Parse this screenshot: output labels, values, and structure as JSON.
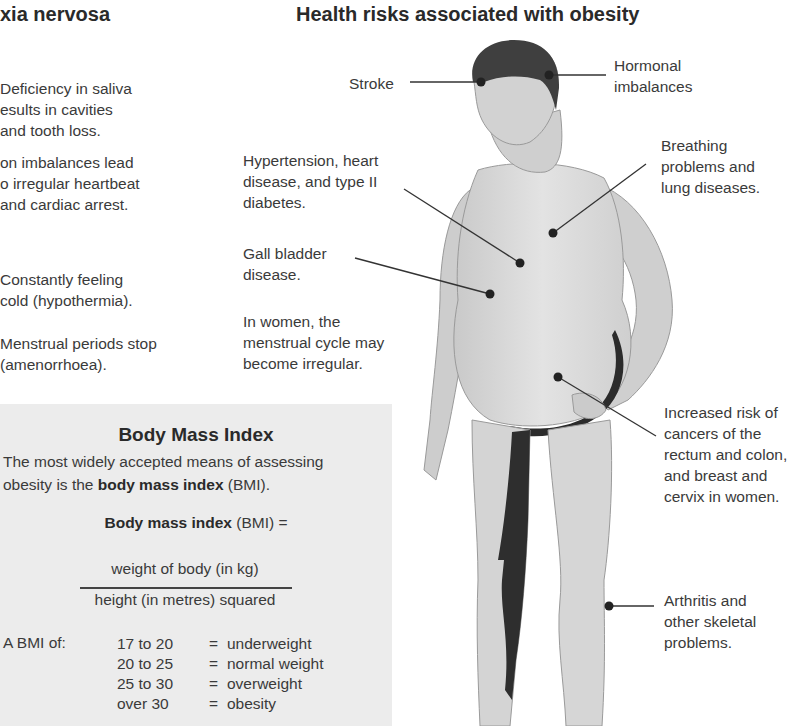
{
  "left_section": {
    "title": "xia nervosa",
    "effects": [
      {
        "text": "Deficiency in saliva\nesults in cavities\nand tooth loss."
      },
      {
        "text": "on imbalances lead\no irregular heartbeat\nand cardiac arrest."
      },
      {
        "text": "Constantly feeling\ncold (hypothermia)."
      },
      {
        "text": "Menstrual periods stop\n(amenorrhoea)."
      }
    ]
  },
  "bmi_panel": {
    "title": "Body Mass Index",
    "intro_line1": "The most widely accepted means of assessing",
    "intro_line2_prefix": "obesity is the ",
    "intro_line2_bold": "body mass index",
    "intro_line2_suffix": " (BMI).",
    "formula_bold": "Body mass index",
    "formula_suffix": " (BMI) =",
    "numerator": "weight of body (in kg)",
    "denominator": "height (in metres) squared",
    "a_bmi_of_label": "A BMI of:",
    "categories": [
      {
        "range": "17 to 20",
        "eq": "=",
        "category": "underweight"
      },
      {
        "range": "20 to 25",
        "eq": "=",
        "category": "normal weight"
      },
      {
        "range": "25 to 30",
        "eq": "=",
        "category": "overweight"
      },
      {
        "range": "over 30",
        "eq": "=",
        "category": "obesity"
      }
    ]
  },
  "diagram": {
    "title": "Health risks associated with obesity",
    "labels": {
      "stroke": "Stroke",
      "hormonal": "Hormonal\nimbalances",
      "hypertension": "Hypertension, heart\ndisease, and type II\ndiabetes.",
      "breathing": "Breathing\nproblems and\nlung diseases.",
      "gall_bladder": "Gall bladder\ndisease.",
      "menstrual": "In women, the\nmenstrual cycle may\nbecome irregular.",
      "cancers": "Increased risk of\ncancers of the\nrectum and colon,\nand breast and\ncervix in women.",
      "arthritis": "Arthritis and\nother skeletal\nproblems."
    },
    "colors": {
      "skin": "#d9d9d9",
      "skin_shadow": "#bdbdbd",
      "hair": "#3f3f3f",
      "outline_dark": "#2b2b2b",
      "leader_line": "#333333",
      "marker": "#222222",
      "panel_bg": "#ececec"
    }
  }
}
